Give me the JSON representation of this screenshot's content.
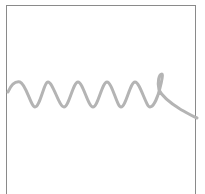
{
  "canvas": {
    "width": 205,
    "height": 194,
    "background": "#ffffff"
  },
  "frame": {
    "color": "#8a8a8a"
  },
  "sketch": {
    "description": "hand-drawn coil / spring squiggle",
    "stroke_color": "#b4b4b4",
    "stroke_width": 3
  }
}
